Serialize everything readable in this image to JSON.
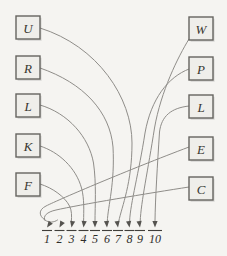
{
  "diagram": {
    "left_nodes": [
      {
        "id": "U",
        "label": "U"
      },
      {
        "id": "R",
        "label": "R"
      },
      {
        "id": "L1",
        "label": "L"
      },
      {
        "id": "K",
        "label": "K"
      },
      {
        "id": "F",
        "label": "F"
      }
    ],
    "right_nodes": [
      {
        "id": "W",
        "label": "W"
      },
      {
        "id": "P",
        "label": "P"
      },
      {
        "id": "L2",
        "label": "L"
      },
      {
        "id": "E",
        "label": "E"
      },
      {
        "id": "C",
        "label": "C"
      }
    ],
    "targets": [
      {
        "number": "1"
      },
      {
        "number": "2"
      },
      {
        "number": "3"
      },
      {
        "number": "4"
      },
      {
        "number": "5"
      },
      {
        "number": "6"
      },
      {
        "number": "7"
      },
      {
        "number": "8"
      },
      {
        "number": "9"
      },
      {
        "number": "10"
      }
    ],
    "connections": [
      {
        "from": "C",
        "to": "1"
      },
      {
        "from": "E",
        "to": "2"
      },
      {
        "from": "F",
        "to": "3"
      },
      {
        "from": "K",
        "to": "4"
      },
      {
        "from": "L1",
        "to": "5"
      },
      {
        "from": "R",
        "to": "6"
      },
      {
        "from": "U",
        "to": "7"
      },
      {
        "from": "P",
        "to": "8"
      },
      {
        "from": "W",
        "to": "9"
      },
      {
        "from": "L2",
        "to": "10"
      }
    ],
    "colors": {
      "background": "#f5f4f1",
      "box_fill": "#efeeea",
      "box_stroke": "#666460",
      "curve": "#8f8d89",
      "text": "#2e2c29"
    }
  }
}
